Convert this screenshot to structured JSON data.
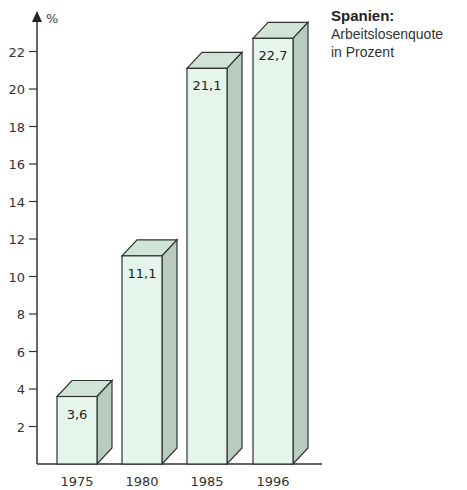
{
  "title": {
    "heading": "Spanien:",
    "line1": "Arbeitslosenquote",
    "line2": "in Prozent"
  },
  "axis": {
    "y_unit": "%",
    "y_ticks": [
      "2",
      "4",
      "6",
      "8",
      "10",
      "12",
      "14",
      "16",
      "18",
      "20",
      "22"
    ]
  },
  "colors": {
    "front": "#e6f5ec",
    "top": "#cfe3d6",
    "side": "#b9cbbf",
    "edge": "#333333"
  },
  "chart_data": {
    "type": "bar",
    "title": "Spanien: Arbeitslosenquote in Prozent",
    "xlabel": "",
    "ylabel": "%",
    "categories": [
      "1975",
      "1980",
      "1985",
      "1996"
    ],
    "values": [
      3.6,
      11.1,
      21.1,
      22.7
    ],
    "value_labels": [
      "3,6",
      "11,1",
      "21,1",
      "22,7"
    ],
    "ylim": [
      0,
      23
    ],
    "y_ticks": [
      2,
      4,
      6,
      8,
      10,
      12,
      14,
      16,
      18,
      20,
      22
    ],
    "grid": false,
    "style": "3d-bars"
  }
}
